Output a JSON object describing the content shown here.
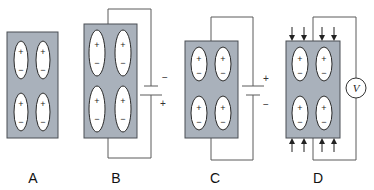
{
  "figure": {
    "colors": {
      "crystal_fill": "#a9b1bb",
      "crystal_border": "#4a4f55",
      "dipole_fill": "#ffffff",
      "wire": "#5b5b5b"
    },
    "dipole_symbols": {
      "top": "+",
      "bottom": "−"
    },
    "panels": [
      {
        "id": "A",
        "label": "A",
        "circuit": "none"
      },
      {
        "id": "B",
        "label": "B",
        "circuit": "battery",
        "battery_top": "−",
        "battery_bottom": "+",
        "effect": "crystal elongated"
      },
      {
        "id": "C",
        "label": "C",
        "circuit": "battery",
        "battery_top": "+",
        "battery_bottom": "−",
        "effect": "crystal compressed"
      },
      {
        "id": "D",
        "label": "D",
        "circuit": "voltmeter",
        "meter_label": "V",
        "effect": "mechanical compression arrows top and bottom"
      }
    ]
  }
}
